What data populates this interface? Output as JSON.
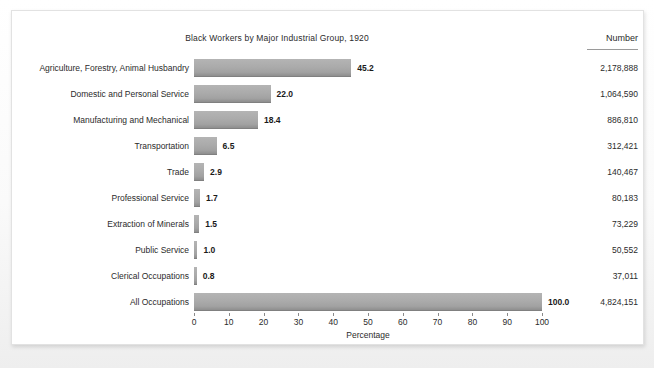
{
  "chart_data": {
    "type": "bar",
    "orientation": "horizontal",
    "title": "Black Workers by Major Industrial Group, 1920",
    "xlabel": "Percentage",
    "ylabel": "",
    "xlim": [
      0,
      100
    ],
    "xticks": [
      "0",
      "10",
      "20",
      "30",
      "40",
      "50",
      "60",
      "70",
      "80",
      "90",
      "100"
    ],
    "grid": false,
    "legend": false,
    "number_column_header": "Number",
    "categories": [
      "Agriculture, Forestry, Animal Husbandry",
      "Domestic and Personal Service",
      "Manufacturing and Mechanical",
      "Transportation",
      "Trade",
      "Professional Service",
      "Extraction of Minerals",
      "Public Service",
      "Clerical Occupations",
      "All Occupations"
    ],
    "values": [
      45.2,
      22.0,
      18.4,
      6.5,
      2.9,
      1.7,
      1.5,
      1.0,
      0.8,
      100.0
    ],
    "value_labels": [
      "45.2",
      "22.0",
      "18.4",
      "6.5",
      "2.9",
      "1.7",
      "1.5",
      "1.0",
      "0.8",
      "100.0"
    ],
    "numbers": [
      "2,178,888",
      "1,064,590",
      "886,810",
      "312,421",
      "140,467",
      "80,183",
      "73,229",
      "50,552",
      "37,011",
      "4,824,151"
    ],
    "colors": {
      "bar_fill": "#ababab",
      "bar_edge": "#808080",
      "text": "#2b2b2b",
      "card_background": "#ffffff",
      "page_background": "#f2f2f2"
    }
  }
}
